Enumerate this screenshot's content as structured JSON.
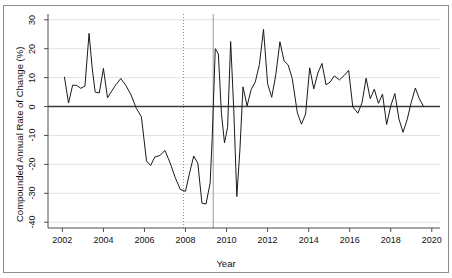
{
  "chart_data": {
    "type": "line",
    "title": "",
    "xlabel": "Year",
    "ylabel": "Compounded Annual Rate of Change (%)",
    "xlim": [
      2001.3,
      2020.4
    ],
    "ylim": [
      -42,
      32
    ],
    "xticks": [
      2002,
      2004,
      2006,
      2008,
      2010,
      2012,
      2014,
      2016,
      2018,
      2020
    ],
    "xtick_labels": [
      "2002",
      "2004",
      "2006",
      "2008",
      "2010",
      "2012",
      "2014",
      "2016",
      "2018",
      "2020"
    ],
    "yticks": [
      30,
      20,
      10,
      0,
      -10,
      -20,
      -30,
      -40
    ],
    "ytick_labels": [
      "30",
      "20",
      "10",
      "0",
      "-10",
      "-20",
      "-30",
      "-40"
    ],
    "grid": "horizontal-light",
    "legend": "none",
    "series_color": "#1a1a1a",
    "zero_line_color": "#3a3a3a",
    "gridline_color": "#e2e2e2",
    "axis_color": "#4d4d4d",
    "frame_color": "#8d8d8d",
    "reference_lines": [
      {
        "name": "dotted-marker-2008",
        "x": 2007.9,
        "style": "dotted",
        "color": "#8a8a8a"
      },
      {
        "name": "solid-marker-2009",
        "x": 2009.35,
        "style": "solid",
        "color": "#9a9a9a"
      }
    ],
    "x": [
      2002.1,
      2002.3,
      2002.5,
      2002.7,
      2002.9,
      2003.1,
      2003.3,
      2003.45,
      2003.6,
      2003.8,
      2004.0,
      2004.2,
      2004.4,
      2004.6,
      2004.85,
      2005.1,
      2005.35,
      2005.6,
      2005.85,
      2006.1,
      2006.3,
      2006.5,
      2006.75,
      2007.0,
      2007.25,
      2007.5,
      2007.75,
      2008.0,
      2008.2,
      2008.4,
      2008.6,
      2008.8,
      2009.0,
      2009.2,
      2009.3,
      2009.45,
      2009.6,
      2009.75,
      2009.9,
      2010.05,
      2010.2,
      2010.35,
      2010.5,
      2010.65,
      2010.8,
      2011.0,
      2011.2,
      2011.4,
      2011.6,
      2011.8,
      2012.0,
      2012.2,
      2012.4,
      2012.6,
      2012.8,
      2013.0,
      2013.2,
      2013.45,
      2013.65,
      2013.85,
      2014.05,
      2014.25,
      2014.45,
      2014.65,
      2014.85,
      2015.05,
      2015.25,
      2015.5,
      2015.75,
      2015.95,
      2016.15,
      2016.4,
      2016.6,
      2016.8,
      2017.0,
      2017.2,
      2017.4,
      2017.6,
      2017.8,
      2018.0,
      2018.2,
      2018.4,
      2018.6,
      2018.8,
      2019.0,
      2019.2,
      2019.4,
      2019.6
    ],
    "values": [
      10.3,
      1.2,
      7.4,
      7.3,
      6.3,
      7.1,
      25.3,
      13.5,
      5.0,
      4.7,
      13.2,
      3.0,
      5.3,
      7.5,
      9.7,
      7.2,
      4.0,
      -0.6,
      -3.5,
      -18.8,
      -20.4,
      -17.5,
      -16.9,
      -15.2,
      -19.5,
      -24.6,
      -28.7,
      -29.3,
      -22.9,
      -17.1,
      -19.6,
      -33.4,
      -33.7,
      -26.4,
      -11.0,
      20.0,
      18.2,
      -2.3,
      -12.6,
      -7.2,
      22.5,
      -1.0,
      -31.1,
      -15.0,
      6.8,
      0.2,
      5.9,
      8.5,
      14.5,
      26.7,
      7.9,
      3.2,
      11.0,
      22.4,
      15.8,
      14.4,
      9.7,
      -2.2,
      -6.1,
      -2.6,
      13.4,
      6.1,
      11.6,
      14.9,
      7.5,
      8.5,
      10.6,
      9.2,
      10.9,
      12.5,
      -0.1,
      -2.3,
      1.3,
      9.8,
      2.7,
      6.0,
      1.1,
      4.3,
      -6.2,
      0.2,
      4.5,
      -4.3,
      -8.9,
      -4.5,
      1.5,
      6.4,
      2.6,
      0.0
    ]
  },
  "axes": {
    "xlabel": "Year",
    "ylabel": "Compounded Annual Rate of Change (%)"
  }
}
